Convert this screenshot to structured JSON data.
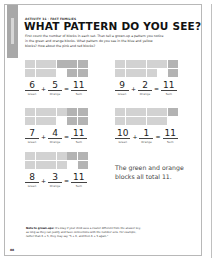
{
  "header": {
    "activity_label": "ACTIVITY 31 · FACT FAMILIES",
    "title": "WHAT PATTERN DO YOU SEE?",
    "intro": "First count the number of blocks in each set. Then tell a grown-up a pattern you notice in the green and orange blocks. What pattern do you see in the blue and yellow blocks? How about the pink and red blocks?"
  },
  "colors": {
    "green_block": "#d2d2d2",
    "orange_block": "#b3b3b3",
    "side_tab": "#a8a8a8"
  },
  "labels": {
    "green": "Green",
    "orange": "Orange",
    "sum": "Sum",
    "plus": "+",
    "equals": "="
  },
  "problems": [
    {
      "green": "6",
      "orange": "5",
      "sum": "11"
    },
    {
      "green": "9",
      "orange": "2",
      "sum": "11"
    },
    {
      "green": "7",
      "orange": "4",
      "sum": "11"
    },
    {
      "green": "10",
      "orange": "1",
      "sum": "11"
    },
    {
      "green": "8",
      "orange": "3",
      "sum": "11"
    }
  ],
  "answer_text": "The green and orange blocks all total 11.",
  "note": {
    "bold": "Note to grown-ups:",
    "text": " It's okay if your child uses a cluster different from the answer key, as long as they can justify and have connections with the number sets. For example, rather than 6 + 5, they may say \"5 + 6, and then 6 + 5 again.\""
  },
  "page_number": "88"
}
